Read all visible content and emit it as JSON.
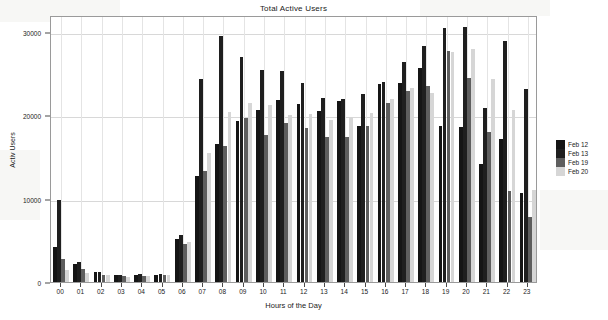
{
  "chart_data": {
    "type": "bar",
    "title": "Total Active Users",
    "xlabel": "Hours of the Day",
    "ylabel": "Activ Users",
    "categories": [
      "00",
      "01",
      "02",
      "03",
      "04",
      "05",
      "06",
      "07",
      "08",
      "09",
      "10",
      "11",
      "12",
      "13",
      "14",
      "15",
      "16",
      "17",
      "18",
      "19",
      "20",
      "21",
      "22",
      "23"
    ],
    "ylim": [
      0,
      32000
    ],
    "yticks": [
      0,
      10000,
      20000,
      30000
    ],
    "ytick_labels": [
      "0",
      "10000",
      "20000",
      "30000"
    ],
    "grid": true,
    "legend_position": "right",
    "series": [
      {
        "name": "Feb 12",
        "color": "#151515",
        "values": [
          4200,
          2100,
          1150,
          850,
          800,
          900,
          5200,
          12700,
          16600,
          19300,
          20600,
          21800,
          21300,
          20500,
          21700,
          18700,
          23700,
          23800,
          25600,
          18700,
          18600,
          14200,
          17200,
          10700
        ]
      },
      {
        "name": "Feb 13",
        "color": "#1f1f1f",
        "values": [
          9800,
          2400,
          1200,
          900,
          950,
          1000,
          5600,
          24300,
          29500,
          27000,
          25400,
          25300,
          23900,
          22100,
          21900,
          22500,
          24000,
          26400,
          28300,
          30400,
          30600,
          20900,
          28900,
          23100
        ]
      },
      {
        "name": "Feb 19",
        "color": "#5e5e5e",
        "values": [
          2700,
          1500,
          900,
          700,
          750,
          800,
          4500,
          13300,
          16300,
          19700,
          17600,
          19100,
          18400,
          17400,
          17400,
          18700,
          21500,
          22900,
          23500,
          27700,
          24500,
          18000,
          10900,
          7800
        ]
      },
      {
        "name": "Feb 20",
        "color": "#d6d6d6",
        "values": [
          1400,
          1100,
          800,
          650,
          700,
          850,
          4800,
          15500,
          20400,
          21400,
          21200,
          20000,
          20100,
          19400,
          19800,
          20200,
          21900,
          23300,
          22700,
          27600,
          27900,
          24300,
          20600,
          11000
        ]
      }
    ]
  },
  "legend": {
    "items": [
      {
        "label": "Feb 12"
      },
      {
        "label": "Feb 13"
      },
      {
        "label": "Feb 19"
      },
      {
        "label": "Feb 20"
      }
    ]
  }
}
